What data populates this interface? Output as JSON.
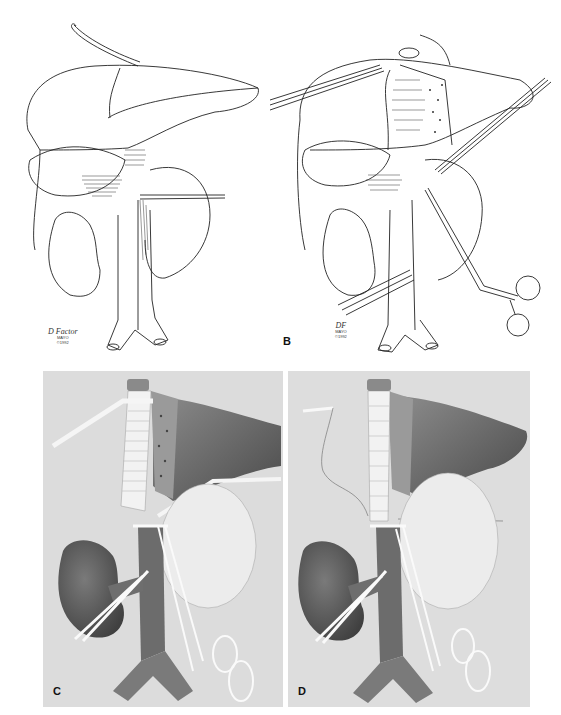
{
  "figure": {
    "panels": [
      {
        "id": "A",
        "label": "",
        "style": "line-drawing",
        "signature": "D Factor",
        "signature_sub": [
          "MAYO",
          "©1992"
        ]
      },
      {
        "id": "B",
        "label": "B",
        "style": "line-drawing",
        "signature": "DF",
        "signature_sub": [
          "MAYO",
          "©1992"
        ]
      },
      {
        "id": "C",
        "label": "C",
        "style": "shaded-illustration"
      },
      {
        "id": "D",
        "label": "D",
        "style": "shaded-illustration"
      }
    ],
    "colors": {
      "background": "#ffffff",
      "line": "#222222",
      "panel_shade_bg": "#dcdcdc",
      "organ_dark": "#5e5e5e",
      "organ_mid": "#8a8a8a",
      "organ_light": "#ececec"
    }
  }
}
